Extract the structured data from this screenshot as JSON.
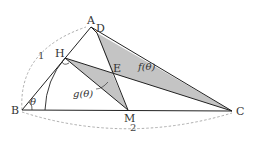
{
  "figure": {
    "type": "geometry",
    "colors": {
      "line": "#222222",
      "shade": "#c4c4c4",
      "dashed": "#999999",
      "background": "#ffffff"
    },
    "points": [
      {
        "name": "A",
        "x": 91,
        "y": 27
      },
      {
        "name": "B",
        "x": 22,
        "y": 110
      },
      {
        "name": "C",
        "x": 232,
        "y": 111
      },
      {
        "name": "D",
        "x": 97,
        "y": 33
      },
      {
        "name": "E",
        "x": 112,
        "y": 73
      },
      {
        "name": "H",
        "x": 65,
        "y": 58
      },
      {
        "name": "M",
        "x": 128,
        "y": 110
      }
    ],
    "labels": {
      "A": "A",
      "B": "B",
      "C": "C",
      "D": "D",
      "E": "E",
      "H": "H",
      "M": "M",
      "theta": "θ",
      "f": "f(θ)",
      "g": "g(θ)",
      "side_ab": "1",
      "side_bc": "2"
    },
    "regions": [
      {
        "name": "f(θ)",
        "vertices": [
          "D",
          "E",
          "C"
        ],
        "shaded": true
      },
      {
        "name": "g(θ)",
        "vertices": [
          "H",
          "E",
          "M"
        ],
        "shaded": true
      }
    ],
    "segments": [
      [
        "B",
        "A"
      ],
      [
        "A",
        "C"
      ],
      [
        "B",
        "C"
      ],
      [
        "H",
        "C"
      ],
      [
        "D",
        "M"
      ],
      [
        "H",
        "M"
      ]
    ],
    "annotations": [
      "right-angle at H",
      "angle θ at B",
      "dashed arc length 1 from B to A",
      "dashed arc length 2 from B to C",
      "arc centered at B through H"
    ]
  }
}
